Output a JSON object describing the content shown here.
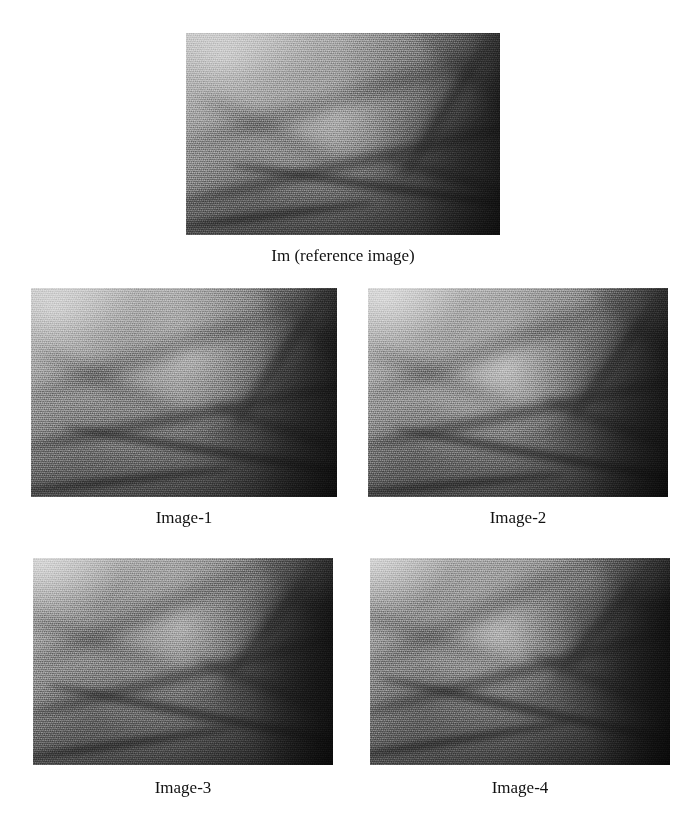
{
  "figure": {
    "background_color": "#ffffff",
    "text_color": "#111111",
    "panel_count": 5,
    "layout": "1 reference image on top, 2x2 grid of variant images below, each labelled beneath",
    "panels": [
      {
        "id": "reference",
        "caption": "Im (reference image)",
        "image_kind": "grayscale-vein-texture",
        "x": 186,
        "y": 33,
        "width": 314,
        "height": 202
      },
      {
        "id": "image-1",
        "caption": "Image-1",
        "image_kind": "grayscale-vein-texture",
        "x": 31,
        "y": 288,
        "width": 306,
        "height": 209
      },
      {
        "id": "image-2",
        "caption": "Image-2",
        "image_kind": "grayscale-vein-texture",
        "x": 368,
        "y": 288,
        "width": 300,
        "height": 209
      },
      {
        "id": "image-3",
        "caption": "Image-3",
        "image_kind": "grayscale-vein-texture",
        "x": 33,
        "y": 558,
        "width": 300,
        "height": 207
      },
      {
        "id": "image-4",
        "caption": "Image-4",
        "image_kind": "grayscale-vein-texture",
        "x": 370,
        "y": 558,
        "width": 300,
        "height": 207
      }
    ],
    "captions": {
      "reference": "Im (reference image)",
      "image_1": "Image-1",
      "image_2": "Image-2",
      "image_3": "Image-3",
      "image_4": "Image-4"
    }
  }
}
